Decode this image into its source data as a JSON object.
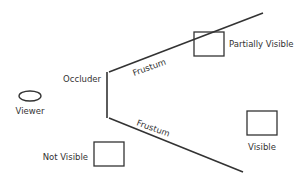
{
  "diagram": {
    "colors": {
      "stroke": "#333333",
      "text": "#333333",
      "background": "#ffffff"
    },
    "labels": {
      "viewer": "Viewer",
      "occluder": "Occluder",
      "frustum_upper": "Frustum",
      "frustum_lower": "Frustum",
      "partially_visible": "Partially Visible",
      "not_visible": "Not Visible",
      "visible": "Visible"
    },
    "objects": [
      {
        "id": "partially-visible",
        "shape": "rectangle",
        "label": "Partially Visible"
      },
      {
        "id": "not-visible",
        "shape": "rectangle",
        "label": "Not Visible"
      },
      {
        "id": "visible",
        "shape": "rectangle",
        "label": "Visible"
      },
      {
        "id": "viewer",
        "shape": "ellipse",
        "label": "Viewer"
      },
      {
        "id": "occluder",
        "shape": "line",
        "label": "Occluder"
      }
    ]
  }
}
